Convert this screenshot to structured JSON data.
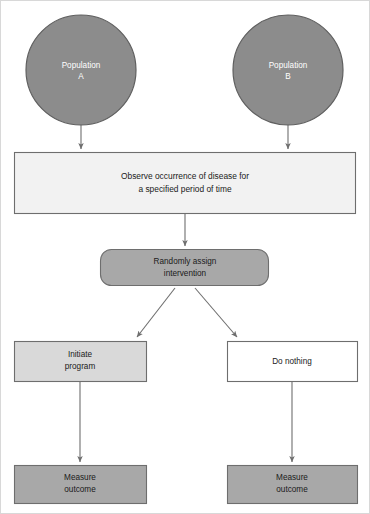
{
  "diagram": {
    "background_color": "#ffffff",
    "colors": {
      "circle_fill": "#8c8c8c",
      "circle_stroke": "#5f5f5f",
      "light_box_fill": "#f2f2f2",
      "mid_box_fill": "#d9d9d9",
      "dark_box_fill": "#a8a8a8",
      "white_box_fill": "#ffffff",
      "box_stroke": "#6e6e6e",
      "arrow_color": "#6e6e6e",
      "text_dark": "#1a1a1a",
      "text_light": "#ffffff"
    },
    "nodes": {
      "population_a": {
        "shape": "circle",
        "line1": "Population",
        "line2": "A",
        "cx": 81,
        "cy": 70,
        "r": 55,
        "fill": "#8c8c8c",
        "text_color": "#ffffff"
      },
      "population_b": {
        "shape": "circle",
        "line1": "Population",
        "line2": "B",
        "cx": 288,
        "cy": 70,
        "r": 55,
        "fill": "#8c8c8c",
        "text_color": "#ffffff"
      },
      "observe": {
        "shape": "rect",
        "line1": "Observe occurrence of disease for",
        "line2": "a specified period of time",
        "x": 14,
        "y": 152,
        "width": 342,
        "height": 62,
        "fill": "#f2f2f2",
        "text_color": "#1a1a1a"
      },
      "randomize": {
        "shape": "rounded-rect",
        "line1": "Randomly assign",
        "line2": "intervention",
        "x": 100,
        "y": 249,
        "width": 169,
        "height": 37,
        "radius": 11,
        "fill": "#a8a8a8",
        "text_color": "#1a1a1a"
      },
      "initiate_program": {
        "shape": "rect",
        "line1": "Initiate",
        "line2": "program",
        "x": 14,
        "y": 341,
        "width": 133,
        "height": 41,
        "fill": "#d9d9d9",
        "text_color": "#1a1a1a"
      },
      "do_nothing": {
        "shape": "rect",
        "line1": "Do nothing",
        "line2": "",
        "x": 227,
        "y": 341,
        "width": 131,
        "height": 41,
        "fill": "#ffffff",
        "text_color": "#1a1a1a"
      },
      "measure_outcome_left": {
        "shape": "rect",
        "line1": "Measure",
        "line2": "outcome",
        "x": 14,
        "y": 465,
        "width": 133,
        "height": 39,
        "fill": "#a8a8a8",
        "text_color": "#1a1a1a"
      },
      "measure_outcome_right": {
        "shape": "rect",
        "line1": "Measure",
        "line2": "outcome",
        "x": 227,
        "y": 465,
        "width": 131,
        "height": 39,
        "fill": "#a8a8a8",
        "text_color": "#1a1a1a"
      }
    },
    "connectors": [
      {
        "name": "population-a-to-observe",
        "from": "population_a",
        "to": "observe",
        "kind": "vertical-arrow"
      },
      {
        "name": "population-b-to-observe",
        "from": "population_b",
        "to": "observe",
        "kind": "vertical-arrow"
      },
      {
        "name": "observe-to-randomize",
        "from": "observe",
        "to": "randomize",
        "kind": "vertical-arrow"
      },
      {
        "name": "randomize-to-initiate-program",
        "from": "randomize",
        "to": "initiate_program",
        "kind": "diagonal-arrow"
      },
      {
        "name": "randomize-to-do-nothing",
        "from": "randomize",
        "to": "do_nothing",
        "kind": "diagonal-arrow"
      },
      {
        "name": "initiate-program-to-measure-outcome",
        "from": "initiate_program",
        "to": "measure_outcome_left",
        "kind": "vertical-arrow"
      },
      {
        "name": "do-nothing-to-measure-outcome",
        "from": "do_nothing",
        "to": "measure_outcome_right",
        "kind": "vertical-arrow"
      }
    ]
  }
}
